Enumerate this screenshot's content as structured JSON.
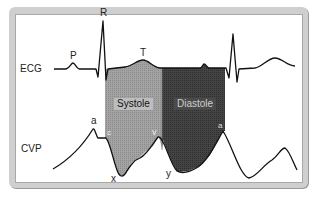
{
  "diagram": {
    "rows": {
      "ecg_label": "ECG",
      "cvp_label": "CVP"
    },
    "ecg_wave_labels": {
      "p": "P",
      "r": "R",
      "t": "T"
    },
    "cvp_wave_labels": {
      "a": "a",
      "c": "c",
      "x": "x",
      "v": "v",
      "y": "y",
      "a2": "a"
    },
    "phases": {
      "systole": "Systole",
      "diastole": "Diastole"
    },
    "colors": {
      "systole_fill": "#9a9a9a",
      "diastole_fill": "#3c3c3c",
      "trace": "#111111",
      "frame": "#cfcfcf"
    }
  }
}
